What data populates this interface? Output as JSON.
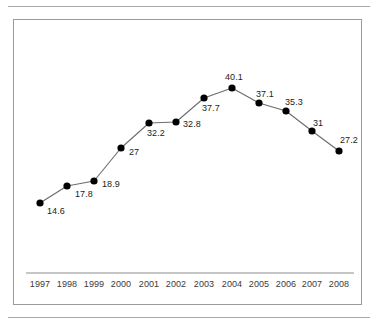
{
  "chart_data": {
    "type": "line",
    "title": "",
    "subtitle": "",
    "xlabel": "",
    "ylabel": "",
    "grid": false,
    "legend": null,
    "xlim": [
      1997,
      2008
    ],
    "ylim": [
      0,
      44
    ],
    "categories": [
      "1997",
      "1998",
      "1999",
      "2000",
      "2001",
      "2002",
      "2003",
      "2004",
      "2005",
      "2006",
      "2007",
      "2008"
    ],
    "values": [
      14.6,
      17.8,
      18.9,
      27,
      32.2,
      32.8,
      37.7,
      40.1,
      37.1,
      35.3,
      31,
      27.2
    ],
    "point_labels": [
      "14.6",
      "17.8",
      "18.9",
      "27",
      "32.2",
      "32.8",
      "37.7",
      "40.1",
      "37.1",
      "35.3",
      "31",
      "27.2"
    ],
    "tick_labels": [
      "1997",
      "1998",
      "1999",
      "2000",
      "2001",
      "2002",
      "2003",
      "2004",
      "2005",
      "2006",
      "2007",
      "2008"
    ],
    "series": [
      {
        "name": "series-1",
        "values": [
          14.6,
          17.8,
          18.9,
          27,
          32.2,
          32.8,
          37.7,
          40.1,
          37.1,
          35.3,
          31,
          27.2
        ]
      }
    ],
    "colors": {
      "line": "#6b6b6b",
      "marker": "#000000",
      "label_text": "#1c1c1c",
      "tick_text": "#3a3a3a",
      "axis_line": "#8d8d8d",
      "frame_border": "#9a9a9a",
      "rule": "#a8a8a8",
      "background": "#ffffff"
    },
    "geometry": {
      "points_px": [
        {
          "x": 39,
          "y": 202
        },
        {
          "x": 66,
          "y": 185
        },
        {
          "x": 93,
          "y": 180
        },
        {
          "x": 120,
          "y": 147
        },
        {
          "x": 148,
          "y": 122
        },
        {
          "x": 175,
          "y": 121
        },
        {
          "x": 203,
          "y": 97
        },
        {
          "x": 231,
          "y": 87
        },
        {
          "x": 258,
          "y": 102
        },
        {
          "x": 285,
          "y": 110
        },
        {
          "x": 311,
          "y": 130
        },
        {
          "x": 338,
          "y": 150
        }
      ],
      "label_px": [
        {
          "x": 46,
          "y": 205
        },
        {
          "x": 74,
          "y": 188
        },
        {
          "x": 101,
          "y": 178
        },
        {
          "x": 128,
          "y": 146
        },
        {
          "x": 146,
          "y": 127
        },
        {
          "x": 182,
          "y": 118
        },
        {
          "x": 201,
          "y": 102
        },
        {
          "x": 224,
          "y": 71
        },
        {
          "x": 255,
          "y": 88
        },
        {
          "x": 284,
          "y": 96
        },
        {
          "x": 312,
          "y": 117
        },
        {
          "x": 339,
          "y": 134
        }
      ],
      "tick_px": [
        39,
        66,
        93,
        120,
        148,
        175,
        203,
        231,
        258,
        285,
        311,
        338
      ],
      "axis_line": {
        "x1": 25,
        "x2": 353,
        "y": 272
      },
      "tick_label_y": 278
    }
  }
}
